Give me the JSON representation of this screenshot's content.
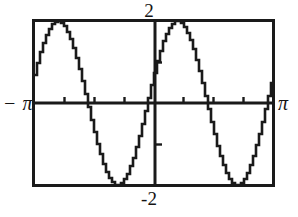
{
  "figure": {
    "kind": "graphing-calculator-plot",
    "background_color": "#ffffff",
    "ink_color": "#1a1a1a"
  },
  "labels": {
    "y_max": "2",
    "y_min": "-2",
    "x_min": "− π",
    "x_max": "π"
  },
  "chart_data": {
    "type": "line",
    "title": "",
    "xlabel": "",
    "ylabel": "",
    "xlim": [
      -3.14159265,
      3.14159265
    ],
    "ylim": [
      -2,
      2
    ],
    "xlim_labels": [
      "− π",
      "π"
    ],
    "ylim_labels": [
      "-2",
      "2"
    ],
    "grid": false,
    "legend": null,
    "axes": {
      "x_axis_at_y": 0,
      "y_axis_at_x": 0,
      "x_tick_count": 8,
      "y_tick_count": 4,
      "x_tick_spacing": 0.7853981634,
      "y_tick_spacing": 1.0,
      "frame": true
    },
    "series": [
      {
        "name": "y = 2 sin(2x + 0.35)",
        "amplitude": 2,
        "periods_shown": 2,
        "rendered_style": "pixelated-stairstep",
        "key_points": [
          {
            "x": -3.14159,
            "y": 1.18
          },
          {
            "x": -2.95,
            "y": 1.55
          },
          {
            "x": -2.79,
            "y": 1.95
          },
          {
            "x": -2.62,
            "y": 2.0
          },
          {
            "x": -2.44,
            "y": 1.86
          },
          {
            "x": -2.2,
            "y": 1.3
          },
          {
            "x": -1.96,
            "y": 0.55
          },
          {
            "x": -1.75,
            "y": 0.0
          },
          {
            "x": -1.5,
            "y": -0.9
          },
          {
            "x": -1.2,
            "y": -1.72
          },
          {
            "x": -1.0,
            "y": -2.0
          },
          {
            "x": -0.82,
            "y": -1.92
          },
          {
            "x": -0.6,
            "y": -1.4
          },
          {
            "x": -0.35,
            "y": -0.6
          },
          {
            "x": -0.18,
            "y": 0.0
          },
          {
            "x": 0.0,
            "y": 0.65
          },
          {
            "x": 0.12,
            "y": 1.5
          },
          {
            "x": 0.28,
            "y": 1.95
          },
          {
            "x": 0.48,
            "y": 2.0
          },
          {
            "x": 0.7,
            "y": 1.6
          },
          {
            "x": 0.95,
            "y": 0.85
          },
          {
            "x": 1.2,
            "y": 0.0
          },
          {
            "x": 1.45,
            "y": -0.9
          },
          {
            "x": 1.75,
            "y": -1.75
          },
          {
            "x": 2.0,
            "y": -2.0
          },
          {
            "x": 2.2,
            "y": -1.85
          },
          {
            "x": 2.45,
            "y": -1.25
          },
          {
            "x": 2.7,
            "y": -0.4
          },
          {
            "x": 2.86,
            "y": 0.25
          },
          {
            "x": 3.0,
            "y": 0.85
          },
          {
            "x": 3.14159,
            "y": 1.3
          }
        ]
      }
    ]
  }
}
